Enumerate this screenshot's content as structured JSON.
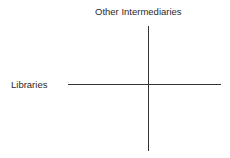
{
  "diagram": {
    "type": "quadrant-axes",
    "labels": {
      "top": "Other Intermediaries",
      "left": "Libraries"
    },
    "colors": {
      "line": "#333333",
      "text": "#2a2a2a",
      "background": "#ffffff"
    }
  }
}
